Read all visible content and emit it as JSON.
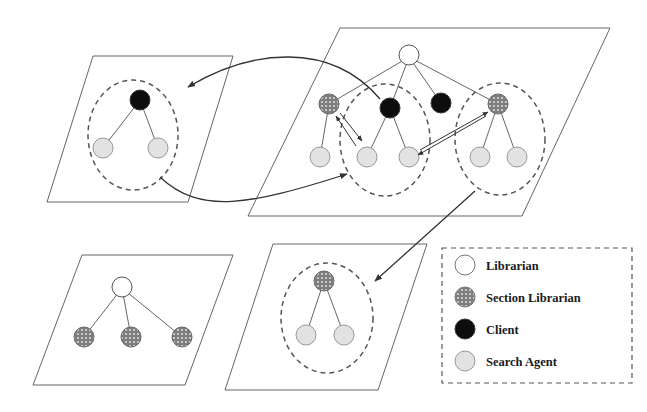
{
  "legend": {
    "items": [
      {
        "label": "Librarian",
        "type": "librarian"
      },
      {
        "label": "Section Librarian",
        "type": "section"
      },
      {
        "label": "Client",
        "type": "client"
      },
      {
        "label": "Search Agent",
        "type": "agent"
      }
    ]
  },
  "colors": {
    "line": "#555555",
    "librarian_fill": "#ffffff",
    "section_fill": "#8a8a8a",
    "client_fill": "#0d0d0d",
    "agent_fill": "#e2e2e2",
    "dashed": "#555555"
  }
}
